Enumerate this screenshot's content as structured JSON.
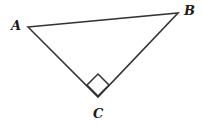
{
  "figure": {
    "type": "geometry-diagram",
    "shape": "right-triangle",
    "background_color": "#ffffff",
    "stroke_color": "#333333",
    "stroke_width": 1.6,
    "canvas": {
      "width": 203,
      "height": 125
    },
    "labels": {
      "a": "A",
      "b": "B",
      "c": "C"
    },
    "vertices": [
      {
        "name": "A",
        "x": 28,
        "y": 27
      },
      {
        "name": "B",
        "x": 178,
        "y": 13
      },
      {
        "name": "C",
        "x": 98,
        "y": 97
      }
    ],
    "sides": [
      {
        "name": "AB",
        "from": "A",
        "to": "B"
      },
      {
        "name": "BC",
        "from": "B",
        "to": "C"
      },
      {
        "name": "CA",
        "from": "C",
        "to": "A"
      }
    ],
    "right_angle": {
      "at_vertex": "C",
      "marker": "square",
      "points": "98,74 109,85 98,96 87,85"
    },
    "polygon_points": "28,27 178,13 98,97"
  }
}
